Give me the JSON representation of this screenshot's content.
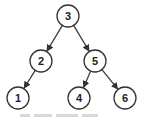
{
  "diagram": {
    "type": "binary-tree",
    "colors": {
      "stroke": "#333333",
      "fill": "#ffffff",
      "text": "#222222"
    },
    "node_radius": 11,
    "nodes": [
      {
        "id": "n3",
        "label": "3",
        "x": 68,
        "y": 16
      },
      {
        "id": "n2",
        "label": "2",
        "x": 41,
        "y": 61
      },
      {
        "id": "n5",
        "label": "5",
        "x": 95,
        "y": 61
      },
      {
        "id": "n1",
        "label": "1",
        "x": 18,
        "y": 98
      },
      {
        "id": "n4",
        "label": "4",
        "x": 79,
        "y": 98
      },
      {
        "id": "n6",
        "label": "6",
        "x": 125,
        "y": 98
      }
    ],
    "edges": [
      {
        "from": "n3",
        "to": "n2"
      },
      {
        "from": "n3",
        "to": "n5"
      },
      {
        "from": "n2",
        "to": "n1"
      },
      {
        "from": "n5",
        "to": "n4"
      },
      {
        "from": "n5",
        "to": "n6"
      }
    ]
  }
}
